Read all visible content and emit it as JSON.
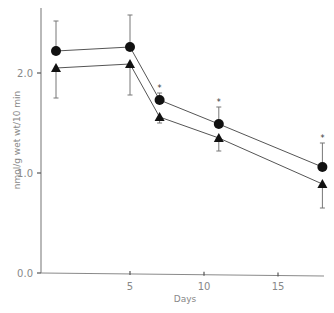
{
  "chart_data": {
    "type": "line",
    "title": "",
    "xlabel": "Days",
    "ylabel": "nmol/g wet wt/10 min",
    "xlim": [
      0,
      18
    ],
    "ylim": [
      0.0,
      2.6
    ],
    "xticks": [
      5,
      10,
      15
    ],
    "yticks": [
      0.0,
      1.0,
      2.0
    ],
    "ytick_labels": [
      "0.0",
      "1.0",
      "2.0"
    ],
    "grid": false,
    "legend": null,
    "x": [
      0,
      5,
      7,
      11,
      18
    ],
    "series": [
      {
        "name": "circle",
        "marker": "circle",
        "values": [
          2.22,
          2.26,
          1.73,
          1.49,
          1.06
        ],
        "error_upper": [
          2.52,
          2.58,
          1.8,
          1.66,
          1.3
        ]
      },
      {
        "name": "triangle",
        "marker": "triangle",
        "values": [
          2.05,
          2.09,
          1.56,
          1.35,
          0.89
        ],
        "error_lower": [
          1.75,
          1.78,
          1.5,
          1.22,
          0.65
        ]
      }
    ],
    "annotations": [
      {
        "x": 7,
        "text": "*"
      },
      {
        "x": 11,
        "text": "*"
      },
      {
        "x": 18,
        "text": "*"
      }
    ]
  }
}
